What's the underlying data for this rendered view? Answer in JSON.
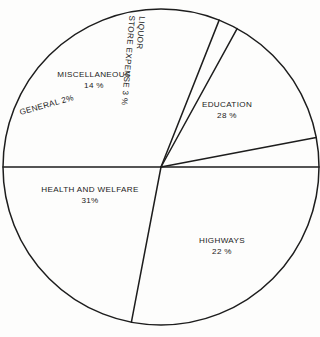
{
  "chart_data": {
    "type": "pie",
    "title": "",
    "subtitle": "",
    "xlabel": "",
    "ylabel": "",
    "legend_position": "none",
    "grid": false,
    "labels_inside_slices": true,
    "unit": "%",
    "categories": [
      "EDUCATION",
      "HIGHWAYS",
      "HEALTH AND WELFARE",
      "GENERAL",
      "MISCELLANEOUS",
      "LIQUOR STORE EXPENSE"
    ],
    "values": [
      28,
      22,
      31,
      2,
      14,
      3
    ],
    "slices": [
      {
        "name": "EDUCATION",
        "value": 28,
        "value_label": "28 %",
        "label_line1": "EDUCATION",
        "label_line2": "28 %",
        "start_angle_deg": 0,
        "end_angle_deg": 100.8,
        "rotation_deg": 0
      },
      {
        "name": "HIGHWAYS",
        "value": 22,
        "value_label": "22 %",
        "label_line1": "HIGHWAYS",
        "label_line2": "22 %",
        "start_angle_deg": 100.8,
        "end_angle_deg": 180,
        "rotation_deg": 0
      },
      {
        "name": "HEALTH AND WELFARE",
        "value": 31,
        "value_label": "31%",
        "label_line1": "HEALTH AND WELFARE",
        "label_line2": "31%",
        "start_angle_deg": 180,
        "end_angle_deg": 291.6,
        "rotation_deg": 0
      },
      {
        "name": "GENERAL",
        "value": 2,
        "value_label": "2%",
        "label_line1": "GENERAL 2%",
        "label_line2": "",
        "start_angle_deg": 291.6,
        "end_angle_deg": 298.8,
        "rotation_deg": -15.5
      },
      {
        "name": "MISCELLANEOUS",
        "value": 14,
        "value_label": "14 %",
        "label_line1": "MISCELLANEOUS",
        "label_line2": "14 %",
        "start_angle_deg": 298.8,
        "end_angle_deg": 349.2,
        "rotation_deg": 0
      },
      {
        "name": "LIQUOR STORE EXPENSE",
        "value": 3,
        "value_label": "3 %",
        "label_line1": "LIQUOR",
        "label_line2": "STORE EXPENSE 3 %",
        "start_angle_deg": 349.2,
        "end_angle_deg": 360,
        "rotation_deg": 95
      }
    ],
    "geometry": {
      "center_x": 161,
      "center_y": 167,
      "radius": 158
    },
    "style": {
      "line_color": "#1d1d1d",
      "fill_color": "#ffffff",
      "background_color": "#fdfdfc",
      "text_color": "#1b1b1b"
    }
  },
  "labels": {
    "education": {
      "name": "EDUCATION",
      "value": "28 %"
    },
    "highways": {
      "name": "HIGHWAYS",
      "value": "22 %"
    },
    "health": {
      "name": "HEALTH AND WELFARE",
      "value": "31%"
    },
    "general": {
      "name": "GENERAL 2%",
      "value": ""
    },
    "miscellaneous": {
      "name": "MISCELLANEOUS",
      "value": "14 %"
    },
    "liquor": {
      "line1": "LIQUOR",
      "line2": "STORE EXPENSE 3 %"
    }
  }
}
